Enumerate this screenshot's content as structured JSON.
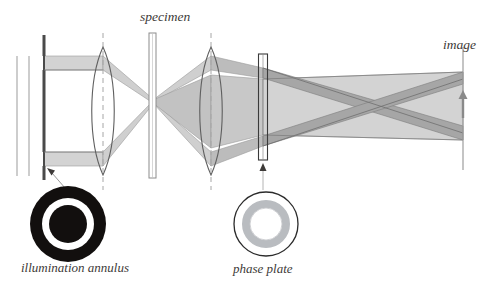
{
  "figure": {
    "title_text": "",
    "background_color": "#ffffff",
    "width": 499,
    "height": 301
  },
  "labels": {
    "specimen": "specimen",
    "image": "image",
    "illumination_annulus": "illumination annulus",
    "phase_plate": "phase plate"
  },
  "colors": {
    "ink": "#3d3a38",
    "direct_beam_fill": "#d3d3d3",
    "diffracted_beam_fill": "#a6a6a6",
    "lens_outline": "#5a5a5a",
    "axis_dash": "#9b9b9b",
    "annulus_dark": "#120f0e",
    "annulus_light": "#ffffff",
    "phase_plate_ring": "#b9bcc0",
    "plate_outline": "#2b2b2b",
    "rail_gray": "#b8b8b8"
  },
  "optical_elements": [
    {
      "name": "light-source-rail-outer",
      "type": "vertical-line",
      "x": 17,
      "y_top": 56,
      "y_bottom": 176
    },
    {
      "name": "light-source-rail-inner",
      "type": "vertical-line",
      "x": 29,
      "y_top": 56,
      "y_bottom": 176
    },
    {
      "name": "illumination-annulus-aperture",
      "type": "aperture",
      "x": 44,
      "y_top": 35,
      "y_bottom": 180
    },
    {
      "name": "condenser-lens",
      "type": "biconvex-lens",
      "x": 103,
      "y_top": 47,
      "y_bottom": 175,
      "half_height": 64
    },
    {
      "name": "specimen-slide",
      "type": "slide",
      "x": 153,
      "y_top": 33,
      "y_bottom": 178
    },
    {
      "name": "objective-lens",
      "type": "biconvex-lens",
      "x": 211,
      "y_top": 47,
      "y_bottom": 175,
      "half_height": 64
    },
    {
      "name": "phase-plate-element",
      "type": "plate",
      "x": 263,
      "y_top": 54,
      "y_bottom": 160
    },
    {
      "name": "image-plane",
      "type": "vertical-line",
      "x": 463,
      "y_top": 47,
      "y_bottom": 170
    }
  ],
  "callouts": [
    {
      "name": "annulus-callout-arrow",
      "from_x": 72,
      "from_y": 196,
      "to_x": 51,
      "to_y": 172
    },
    {
      "name": "phase-plate-callout-line",
      "from_x": 263,
      "from_y": 166,
      "to_x": 263,
      "to_y": 196
    }
  ],
  "annulus_icon": {
    "center_x": 68,
    "center_y": 224,
    "outer_radius": 38,
    "white_ring_radius": 26,
    "inner_dark_radius": 19
  },
  "phase_plate_icon": {
    "center_x": 266,
    "center_y": 224,
    "outer_radius": 32,
    "gray_ring_outer_radius": 24,
    "gray_ring_inner_radius": 16
  },
  "image_marker": {
    "name": "image-arrow",
    "x": 463,
    "tip_y": 93,
    "tail_y": 118
  }
}
